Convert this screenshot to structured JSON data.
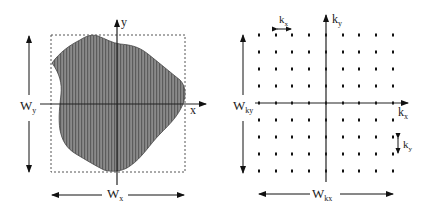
{
  "left_panel": {
    "description": "object in image space",
    "axis_x_label": "x",
    "axis_y_label": "y",
    "width_x_label": "W",
    "width_x_sub": "x",
    "width_y_label": "W",
    "width_y_sub": "y"
  },
  "right_panel": {
    "description": "sampled k-space grid",
    "axis_kx_label": "k",
    "axis_kx_sub": "x",
    "axis_ky_label": "k",
    "axis_ky_sub": "y",
    "delta_kx_label": "k",
    "delta_kx_sub": "x",
    "delta_ky_label": "k",
    "delta_ky_sub": "y",
    "width_kx_label": "W",
    "width_kx_sub": "kx",
    "width_ky_label": "W",
    "width_ky_sub": "ky",
    "grid_columns_x": [
      259,
      276,
      292,
      309,
      326,
      343,
      359,
      376,
      393
    ],
    "grid_rows_y": [
      35,
      52,
      69,
      86,
      103,
      120,
      137,
      154,
      171
    ]
  },
  "colors": {
    "ink": "#111111",
    "shape_fill": "#7a7a7a",
    "hatch": "#5a5a5a",
    "dashed_box": "#555555"
  }
}
